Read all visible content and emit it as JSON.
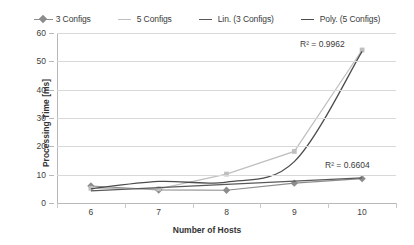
{
  "chart_data": {
    "type": "line",
    "title": "",
    "xlabel": "Number of Hosts",
    "ylabel": "Processing Time [ms]",
    "x": [
      6,
      7,
      8,
      9,
      10
    ],
    "xticklabels": [
      "6",
      "7",
      "8",
      "9",
      "10"
    ],
    "yticklabels": [
      "0",
      "10",
      "20",
      "30",
      "40",
      "50",
      "60"
    ],
    "yticks": [
      0,
      10,
      20,
      30,
      40,
      50,
      60
    ],
    "ylim": [
      0,
      60
    ],
    "xlim": [
      5.5,
      10.5
    ],
    "grid": "horizontal",
    "legend_position": "top",
    "series": [
      {
        "name": "3 Configs",
        "kind": "data",
        "marker": "diamond",
        "color": "#8c8c8c",
        "values": [
          6.0,
          4.6,
          4.5,
          7.0,
          8.6
        ]
      },
      {
        "name": "5 Configs",
        "kind": "data",
        "marker": "square",
        "color": "#bfbfbf",
        "values": [
          5.2,
          5.0,
          10.2,
          18.2,
          54.0
        ]
      },
      {
        "name": "Lin. (3 Configs)",
        "kind": "trendline",
        "fit": "linear",
        "color": "#595959",
        "r_squared": "0.6604",
        "endpoints": [
          4.3,
          8.9
        ]
      },
      {
        "name": "Poly. (5 Configs)",
        "kind": "trendline",
        "fit": "polynomial",
        "color": "#4d4d4d",
        "r_squared": "0.9962",
        "values": [
          5.0,
          7.6,
          7.4,
          14.6,
          53.5
        ]
      }
    ],
    "annotations": [
      {
        "id": "poly",
        "text": "R² = 0.9962"
      },
      {
        "id": "lin",
        "text": "R² = 0.6604"
      }
    ]
  },
  "legend": {
    "items": [
      {
        "label": "3 Configs",
        "style": "marker-line",
        "color": "#8c8c8c"
      },
      {
        "label": "5 Configs",
        "style": "line",
        "color": "#bfbfbf"
      },
      {
        "label": "Lin. (3 Configs)",
        "style": "line",
        "color": "#595959"
      },
      {
        "label": "Poly. (5 Configs)",
        "style": "line",
        "color": "#4d4d4d"
      }
    ]
  }
}
